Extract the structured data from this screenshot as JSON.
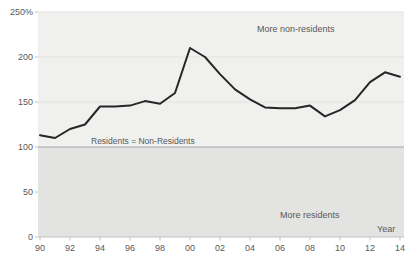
{
  "chart_data": {
    "type": "line",
    "title": "",
    "xlabel": "Year",
    "ylabel": "",
    "ylim": [
      0,
      250
    ],
    "x": [
      1990,
      1991,
      1992,
      1993,
      1994,
      1995,
      1996,
      1997,
      1998,
      1999,
      2000,
      2001,
      2002,
      2003,
      2004,
      2005,
      2006,
      2007,
      2008,
      2009,
      2010,
      2011,
      2012,
      2013,
      2014
    ],
    "values": [
      113,
      110,
      120,
      125,
      145,
      145,
      146,
      151,
      148,
      160,
      210,
      200,
      181,
      164,
      153,
      144,
      143,
      143,
      146,
      134,
      141,
      152,
      172,
      183,
      178
    ],
    "series_name": "non-residents-to-residents-ratio-percent",
    "x_tick_labels": [
      "90",
      "92",
      "94",
      "96",
      "98",
      "00",
      "02",
      "04",
      "06",
      "08",
      "10",
      "12",
      "14"
    ],
    "y_ticks": [
      {
        "value": 250,
        "label": "250%"
      },
      {
        "value": 200,
        "label": "200"
      },
      {
        "value": 150,
        "label": "150"
      },
      {
        "value": 100,
        "label": "100"
      },
      {
        "value": 50,
        "label": "50"
      },
      {
        "value": 0,
        "label": "0"
      }
    ],
    "reference_line_value": 100,
    "annotations": {
      "above": "More non-residents",
      "equality": "Residents = Non-Residents",
      "below": "More residents",
      "xlabel": "Year"
    },
    "legend": "none",
    "grid": "horizontal-faint"
  },
  "colors": {
    "line": "#262626",
    "area_above_100": "#f0f0ef",
    "area_below_100": "#e3e3e2",
    "gridline": "#e2e2e1",
    "equality_line": "#a6a6a6",
    "axis": "#c2c2c1",
    "text": "#595959",
    "background": "#ffffff"
  }
}
